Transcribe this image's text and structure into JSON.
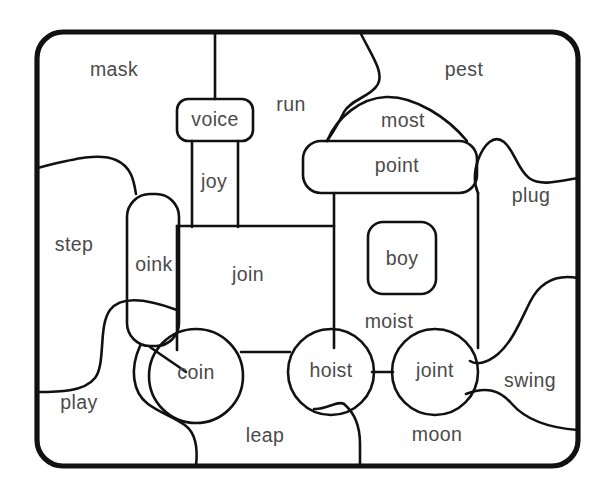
{
  "page": {
    "background_color": "#ffffff",
    "line_color": "#111111",
    "text_color": "#4a4a4a",
    "border_color": "#111111",
    "width": 611,
    "height": 494
  },
  "border": {
    "name": "rounded-frame",
    "x": 37,
    "y": 32,
    "width": 541,
    "height": 434,
    "radius": 26
  },
  "words": [
    {
      "id": "mask",
      "text": "mask",
      "x": 114,
      "y": 71,
      "region": "background-top-left",
      "target": false
    },
    {
      "id": "voice",
      "text": "voice",
      "x": 215,
      "y": 121,
      "region": "train-chimney-cap",
      "target": true
    },
    {
      "id": "run",
      "text": "run",
      "x": 291,
      "y": 106,
      "region": "background-top-mid",
      "target": false
    },
    {
      "id": "pest",
      "text": "pest",
      "x": 464,
      "y": 71,
      "region": "background-top-right",
      "target": false
    },
    {
      "id": "most",
      "text": "most",
      "x": 403,
      "y": 122,
      "region": "train-funnel",
      "target": false
    },
    {
      "id": "point",
      "text": "point",
      "x": 397,
      "y": 166,
      "region": "train-cab-roof",
      "target": true
    },
    {
      "id": "joy",
      "text": "joy",
      "x": 213,
      "y": 183,
      "region": "train-chimney-stack",
      "target": true
    },
    {
      "id": "plug",
      "text": "plug",
      "x": 531,
      "y": 197,
      "region": "background-right",
      "target": false
    },
    {
      "id": "step",
      "text": "step",
      "x": 74,
      "y": 246,
      "region": "background-left",
      "target": false
    },
    {
      "id": "oink",
      "text": "oink",
      "x": 154,
      "y": 266,
      "region": "train-front-buffer",
      "target": true
    },
    {
      "id": "join",
      "text": "join",
      "x": 248,
      "y": 276,
      "region": "train-boiler",
      "target": true
    },
    {
      "id": "boy",
      "text": "boy",
      "x": 401,
      "y": 260,
      "region": "train-cab-window",
      "target": true
    },
    {
      "id": "moist",
      "text": "moist",
      "x": 389,
      "y": 323,
      "region": "train-cab-lower",
      "target": true
    },
    {
      "id": "coin",
      "text": "coin",
      "x": 195,
      "y": 374,
      "region": "train-wheel-front",
      "target": true
    },
    {
      "id": "hoist",
      "text": "hoist",
      "x": 331,
      "y": 372,
      "region": "train-wheel-mid",
      "target": true
    },
    {
      "id": "joint",
      "text": "joint",
      "x": 435,
      "y": 372,
      "region": "train-wheel-rear",
      "target": true
    },
    {
      "id": "play",
      "text": "play",
      "x": 79,
      "y": 404,
      "region": "background-bottom-left",
      "target": false
    },
    {
      "id": "swing",
      "text": "swing",
      "x": 530,
      "y": 382,
      "region": "background-bottom-right",
      "target": false
    },
    {
      "id": "leap",
      "text": "leap",
      "x": 265,
      "y": 437,
      "region": "background-bottom-mid",
      "target": false
    },
    {
      "id": "moon",
      "text": "moon",
      "x": 437,
      "y": 436,
      "region": "background-bottom",
      "target": false
    }
  ],
  "shapes": {
    "chimney_post": {
      "name": "chimney-post",
      "d": "M 215 32 L 215 99"
    },
    "voice_box": {
      "name": "voice-rounded-box",
      "x": 177,
      "y": 99,
      "width": 76,
      "height": 42,
      "radius": 11
    },
    "chimney_stack": {
      "name": "chimney-stack",
      "d": "M 192 141 L 192 227 M 238 141 L 238 227"
    },
    "oink_buffer": {
      "name": "oink-buffer",
      "x": 127,
      "y": 194,
      "width": 52,
      "height": 152,
      "radius": 23
    },
    "boiler_body": {
      "name": "join-boiler",
      "d": "M 177 226 L 328 226 L 328 347 M 177 226 L 177 347"
    },
    "boiler_top_bar": {
      "name": "boiler-top-bar",
      "d": "M 177 226 L 336 226"
    },
    "axle_bar": {
      "name": "wheel-axle-bar",
      "d": "M 243 352 L 291 352"
    },
    "axle_bar2": {
      "name": "wheel-axle-bar-2",
      "d": "M 373 372 L 392 372"
    },
    "cab_body": {
      "name": "cab-body",
      "d": "M 334 192 L 334 348 M 478 192 L 478 348"
    },
    "cab_roof": {
      "name": "point-cab-roof",
      "x": 303,
      "y": 141,
      "width": 174,
      "height": 52,
      "radius": 18
    },
    "cab_window": {
      "name": "boy-window",
      "x": 368,
      "y": 222,
      "width": 68,
      "height": 72,
      "radius": 14
    },
    "funnel": {
      "name": "most-funnel",
      "d": "M 327 141 C 338 116 362 98 386 97 C 414 96 447 118 466 141"
    },
    "wheel_front": {
      "name": "coin-wheel",
      "cx": 196,
      "cy": 376,
      "r": 47
    },
    "wheel_mid": {
      "name": "hoist-wheel",
      "cx": 331,
      "cy": 372,
      "r": 43
    },
    "wheel_rear": {
      "name": "joint-wheel",
      "cx": 435,
      "cy": 372,
      "r": 43
    }
  },
  "background_curves": [
    {
      "name": "curve-top-right-funnel-edge",
      "d": "M 360 32 C 372 56 384 72 378 84 C 372 96 350 100 344 112 C 338 124 332 134 327 141"
    },
    {
      "name": "curve-left-upper",
      "d": "M 37 168 C 70 160 98 152 116 160 C 132 167 134 182 136 194"
    },
    {
      "name": "curve-left-mid",
      "d": "M 177 310 C 150 300 122 294 110 310 C 98 326 106 364 95 378 C 84 392 58 392 37 392"
    },
    {
      "name": "curve-left-lower-to-wheel",
      "d": "M 140 346 C 130 368 132 392 148 404 C 160 413 176 418 186 426 C 196 434 198 448 196 466"
    },
    {
      "name": "curve-diagonal-to-coin",
      "d": "M 151 348 C 162 356 176 364 186 372"
    },
    {
      "name": "curve-right-upper",
      "d": "M 578 178 C 556 182 540 186 529 178 C 518 170 514 150 504 142 C 494 134 484 144 478 160 C 474 172 474 184 478 193"
    },
    {
      "name": "curve-right-lower",
      "d": "M 578 278 C 556 274 540 282 530 302 C 520 322 512 342 498 354 C 486 364 474 366 470 362"
    },
    {
      "name": "curve-bottom-right",
      "d": "M 466 394 C 486 386 500 390 512 404 C 526 420 550 428 578 430"
    },
    {
      "name": "curve-bottom-mid",
      "d": "M 344 404 C 356 414 360 428 360 444 C 360 454 360 461 360 466"
    },
    {
      "name": "curve-wheel-mid-tail",
      "d": "M 316 412 C 328 410 338 400 344 404"
    }
  ],
  "legend": {
    "instruction": null
  }
}
